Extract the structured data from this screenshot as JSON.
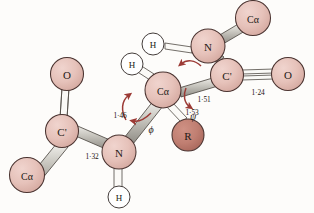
{
  "figure": {
    "type": "molecular-structure-diagram",
    "background_color": "#fdfcfa"
  },
  "colors": {
    "heavy_atom_fill": "#e3bdb6",
    "heavy_atom_fill_light": "#edcdc6",
    "heavy_atom_stroke": "#4a3330",
    "r_group_fill": "#c07f72",
    "r_group_stroke": "#4a3330",
    "hydrogen_fill": "#ffffff",
    "hydrogen_stroke": "#3a3330",
    "bond_fill": "#b4b2ab",
    "bond_fill_light": "#f4f3ef",
    "bond_stroke": "#4f4a44",
    "arrow_color": "#9c3a35",
    "text_color": "#241a16"
  },
  "atoms": [
    {
      "id": "o-left",
      "label": "O",
      "kind": "oxygen",
      "cx": 67,
      "cy": 74,
      "r": 16.5,
      "font_size": 11
    },
    {
      "id": "c-prime-left",
      "label": "C'",
      "kind": "carbonyl-carbon",
      "cx": 62,
      "cy": 131,
      "r": 16.5,
      "font_size": 11
    },
    {
      "id": "ca-bottom-left",
      "label": "Cα",
      "kind": "alpha-carbon",
      "cx": 27,
      "cy": 175,
      "r": 17.5,
      "font_size": 10
    },
    {
      "id": "n-bottom",
      "label": "N",
      "kind": "nitrogen",
      "cx": 119,
      "cy": 152,
      "r": 17,
      "font_size": 11
    },
    {
      "id": "h-bottom",
      "label": "H",
      "kind": "hydrogen",
      "cx": 119,
      "cy": 197,
      "r": 11,
      "font_size": 9
    },
    {
      "id": "ca-center",
      "label": "Cα",
      "kind": "alpha-carbon",
      "cx": 163,
      "cy": 90,
      "r": 18,
      "font_size": 10
    },
    {
      "id": "h-center",
      "label": "H",
      "kind": "hydrogen",
      "cx": 132,
      "cy": 64,
      "r": 11,
      "font_size": 9
    },
    {
      "id": "r-group",
      "label": "R",
      "kind": "side-chain",
      "cx": 188,
      "cy": 135,
      "r": 16,
      "font_size": 11
    },
    {
      "id": "c-prime-right",
      "label": "C'",
      "kind": "carbonyl-carbon",
      "cx": 227,
      "cy": 75,
      "r": 16.5,
      "font_size": 11
    },
    {
      "id": "o-right",
      "label": "O",
      "kind": "oxygen",
      "cx": 288,
      "cy": 74,
      "r": 16.5,
      "font_size": 11
    },
    {
      "id": "n-top",
      "label": "N",
      "kind": "nitrogen",
      "cx": 208,
      "cy": 46,
      "r": 17,
      "font_size": 11
    },
    {
      "id": "h-top",
      "label": "H",
      "kind": "hydrogen",
      "cx": 153,
      "cy": 44,
      "r": 11,
      "font_size": 9
    },
    {
      "id": "ca-top-right",
      "label": "Cα",
      "kind": "alpha-carbon",
      "cx": 253,
      "cy": 18,
      "r": 17.5,
      "font_size": 10
    }
  ],
  "bond_labels": [
    {
      "id": "len-c-n-left",
      "text": "1·32",
      "x": 92,
      "y": 156
    },
    {
      "id": "len-n-ca",
      "text": "1·46",
      "x": 120,
      "y": 115
    },
    {
      "id": "len-ca-r",
      "text": "1·53",
      "x": 192,
      "y": 112
    },
    {
      "id": "len-ca-c",
      "text": "1·51",
      "x": 204,
      "y": 99
    },
    {
      "id": "len-c-o",
      "text": "1·24",
      "x": 258,
      "y": 92
    }
  ],
  "angle_labels": [
    {
      "id": "phi-label",
      "text": "ϕ",
      "x": 151,
      "y": 129
    },
    {
      "id": "psi-label",
      "text": "ψ",
      "x": 193,
      "y": 116
    }
  ]
}
